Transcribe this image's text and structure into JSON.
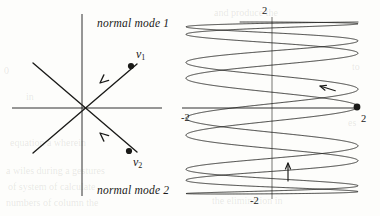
{
  "figure": {
    "background_color": "#fdfdfb",
    "ink_color": "#1a1a18",
    "left_panel": {
      "name": "normal-mode-eigenvector-diagram",
      "mode1_label": "normal mode 1",
      "mode2_label": "normal mode 2",
      "vector1_label": "v",
      "vector1_sub": "1",
      "vector2_label": "v",
      "vector2_sub": "2",
      "axes": {
        "x_axis": {
          "x1": 12,
          "y1": 108,
          "x2": 162,
          "y2": 108
        },
        "y_axis": {
          "x1": 82,
          "y1": 14,
          "x2": 82,
          "y2": 196
        }
      },
      "origin": {
        "x": 82,
        "y": 108
      },
      "mode_lines": [
        {
          "name": "mode-1-line",
          "x1": 33,
          "y1": 63,
          "x2": 137,
          "y2": 152
        },
        {
          "name": "mode-2-line",
          "x1": 33,
          "y1": 153,
          "x2": 137,
          "y2": 64
        }
      ],
      "points": [
        {
          "name": "v1-point",
          "x": 131,
          "y": 66
        },
        {
          "name": "v2-point",
          "x": 129,
          "y": 151
        }
      ],
      "arrows": [
        {
          "name": "mode-1-arrow",
          "tip_x": 100,
          "tip_y": 83,
          "dir": "down-left"
        },
        {
          "name": "mode-2-arrow",
          "tip_x": 100,
          "tip_y": 133,
          "dir": "up-left"
        }
      ]
    },
    "right_panel": {
      "name": "quasiperiodic-orbit-plot",
      "center": {
        "x": 272,
        "y": 108
      },
      "radius": 86,
      "axis_labels": {
        "top": "2",
        "right": "2",
        "left": "-2",
        "bottom": "-2"
      },
      "marker": {
        "name": "orbit-start-point",
        "x": 357,
        "y": 107
      },
      "arrows": [
        {
          "name": "orbit-arrow-upper-right",
          "x": 320,
          "y": 86,
          "dir": "up-left"
        },
        {
          "name": "orbit-arrow-lower-middle",
          "x": 288,
          "y": 163,
          "dir": "up"
        }
      ],
      "curve": {
        "type": "lissajous",
        "x_expr": "2*cos(t)",
        "y_expr": "2*cos(r*t)",
        "frequency_ratio": 0.1075,
        "t_max": 58.5,
        "amplitude": 2
      }
    },
    "page_bleed_text": [
      {
        "text": "0",
        "x": 4,
        "y": 66
      },
      {
        "text": "in",
        "x": 26,
        "y": 92
      },
      {
        "text": "equation a wherein",
        "x": 10,
        "y": 138
      },
      {
        "text": "a wiles   during  a gestures",
        "x": 6,
        "y": 166
      },
      {
        "text": "of  system  of  calculate",
        "x": 8,
        "y": 182
      },
      {
        "text": "numbers    of    column    the",
        "x": 6,
        "y": 198
      },
      {
        "text": "and  produce  the",
        "x": 214,
        "y": 8
      },
      {
        "text": "to",
        "x": 352,
        "y": 62
      },
      {
        "text": "es",
        "x": 348,
        "y": 118
      },
      {
        "text": "the    elimination    in",
        "x": 212,
        "y": 196
      }
    ]
  },
  "chart_data": {
    "type": "line",
    "title": "",
    "charts": [
      {
        "name": "normal-modes",
        "type": "line",
        "xlabel": "",
        "ylabel": "",
        "xlim": [
          -2,
          2
        ],
        "ylim": [
          -2,
          2
        ],
        "grid": false,
        "legend": "none",
        "annotations": [
          "normal mode 1",
          "normal mode 2",
          "v1",
          "v2"
        ],
        "series": [
          {
            "name": "mode 1 eigendirection",
            "x": [
              -1.4,
              1.4
            ],
            "y": [
              1.25,
              -1.25
            ]
          },
          {
            "name": "mode 2 eigendirection",
            "x": [
              -1.4,
              1.4
            ],
            "y": [
              -1.28,
              1.24
            ]
          }
        ],
        "points": [
          {
            "name": "v1",
            "x": 1.38,
            "y": 1.16
          },
          {
            "name": "v2",
            "x": 1.32,
            "y": -1.16
          }
        ]
      },
      {
        "name": "combined-motion-orbit",
        "type": "line",
        "xlabel": "",
        "ylabel": "",
        "xlim": [
          -2,
          2
        ],
        "ylim": [
          -2,
          2
        ],
        "tick_labels": {
          "top": "2",
          "right": "2",
          "left": "-2",
          "bottom": "-2"
        },
        "grid": false,
        "legend": "none",
        "parametric": {
          "x": "2*cos(t)",
          "y": "2*cos(0.1075*t)",
          "t_range": [
            0,
            58.5
          ]
        },
        "points": [
          {
            "name": "start",
            "x": 2,
            "y": 0
          }
        ]
      }
    ]
  }
}
